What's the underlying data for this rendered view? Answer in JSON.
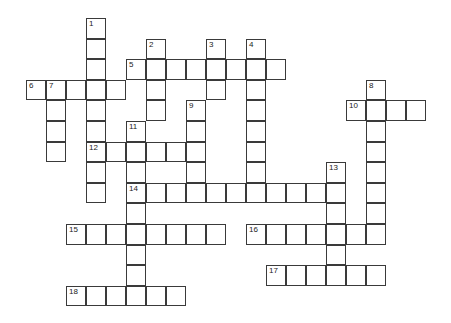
{
  "puzzle": {
    "type": "crossword",
    "grid_origin": {
      "x": 26,
      "y": 18
    },
    "cell_size": {
      "w": 20,
      "h": 20.6
    },
    "colors": {
      "line": "#3a3a3a",
      "cell": "#ffffff",
      "number": "#222222"
    },
    "entries": [
      {
        "number": "1",
        "direction": "down",
        "col": 3,
        "row": 0,
        "length": 9
      },
      {
        "number": "2",
        "direction": "down",
        "col": 6,
        "row": 1,
        "length": 4
      },
      {
        "number": "3",
        "direction": "down",
        "col": 9,
        "row": 1,
        "length": 3
      },
      {
        "number": "4",
        "direction": "down",
        "col": 11,
        "row": 1,
        "length": 8
      },
      {
        "number": "5",
        "direction": "across",
        "col": 5,
        "row": 2,
        "length": 8
      },
      {
        "number": "6",
        "direction": "across",
        "col": 0,
        "row": 3,
        "length": 5
      },
      {
        "number": "7",
        "direction": "down",
        "col": 1,
        "row": 3,
        "length": 4
      },
      {
        "number": "8",
        "direction": "down",
        "col": 17,
        "row": 3,
        "length": 8
      },
      {
        "number": "9",
        "direction": "down",
        "col": 8,
        "row": 4,
        "length": 5
      },
      {
        "number": "10",
        "direction": "across",
        "col": 16,
        "row": 4,
        "length": 4
      },
      {
        "number": "11",
        "direction": "down",
        "col": 5,
        "row": 5,
        "length": 9
      },
      {
        "number": "12",
        "direction": "across",
        "col": 3,
        "row": 6,
        "length": 6
      },
      {
        "number": "13",
        "direction": "down",
        "col": 15,
        "row": 7,
        "length": 6
      },
      {
        "number": "14",
        "direction": "across",
        "col": 5,
        "row": 8,
        "length": 11
      },
      {
        "number": "15",
        "direction": "across",
        "col": 2,
        "row": 10,
        "length": 8
      },
      {
        "number": "16",
        "direction": "across",
        "col": 11,
        "row": 10,
        "length": 7
      },
      {
        "number": "17",
        "direction": "across",
        "col": 12,
        "row": 12,
        "length": 6
      },
      {
        "number": "18",
        "direction": "across",
        "col": 2,
        "row": 13,
        "length": 6
      }
    ]
  }
}
